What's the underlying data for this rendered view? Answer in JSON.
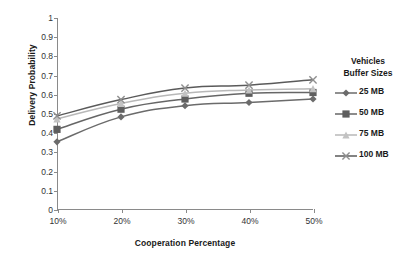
{
  "chart_data": {
    "type": "line",
    "title": "",
    "xlabel": "Cooperation Percentage",
    "ylabel": "Delivery Probability",
    "categories": [
      "10%",
      "20%",
      "30%",
      "40%",
      "50%"
    ],
    "xticklabels": [
      "10%",
      "20%",
      "30%",
      "40%",
      "50%"
    ],
    "yticklabels": [
      "0",
      "0.1",
      "0.2",
      "0.3",
      "0.4",
      "0.5",
      "0.6",
      "0.7",
      "0.8",
      "0.9",
      "1"
    ],
    "ylim": [
      0,
      1
    ],
    "ytick_step": 0.1,
    "grid": false,
    "legend_position": "right",
    "legend_title": "Vehicles Buffer Sizes",
    "series": [
      {
        "name": "25 MB",
        "values": [
          0.355,
          0.485,
          0.543,
          0.56,
          0.578
        ],
        "color": "#6b6b6b",
        "marker": "diamond",
        "marker_color": "#6b6b6b"
      },
      {
        "name": "50 MB",
        "values": [
          0.42,
          0.525,
          0.578,
          0.608,
          0.612
        ],
        "color": "#666666",
        "marker": "square",
        "marker_color": "#5e5e5e"
      },
      {
        "name": "75 MB",
        "values": [
          0.475,
          0.555,
          0.608,
          0.625,
          0.632
        ],
        "color": "#b8b8b8",
        "marker": "triangle",
        "marker_color": "#c2c2c2"
      },
      {
        "name": "100 MB",
        "values": [
          0.49,
          0.575,
          0.635,
          0.65,
          0.678
        ],
        "color": "#5a5a5a",
        "marker": "x",
        "marker_color": "#8f8f8f"
      }
    ]
  },
  "legend": {
    "title_line1": "Vehicles",
    "title_line2": "Buffer Sizes"
  },
  "colors": {
    "axis": "#8a8a8a",
    "text": "#1a1a1a",
    "tick_text": "#333333",
    "background": "#ffffff"
  }
}
